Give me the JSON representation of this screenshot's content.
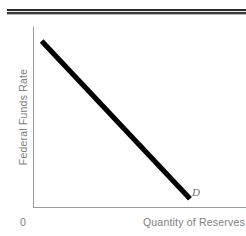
{
  "figure": {
    "name": "federal-funds-rate-demand-for-reserves",
    "background_color": "#ffffff",
    "top_rule": {
      "present": true,
      "color": "#2b2b2b"
    },
    "axes": {
      "color": "#9b9b9b",
      "origin_label": "0"
    },
    "labels": {
      "y_axis": "Federal Funds Rate",
      "x_axis": "Quantity of Reserves",
      "curve": "D"
    }
  },
  "chart_data": {
    "type": "line",
    "title": "",
    "subtitle": "",
    "xlabel": "Quantity of Reserves",
    "ylabel": "Federal Funds Rate",
    "xlim": [
      0,
      1
    ],
    "ylim": [
      0,
      1
    ],
    "grid": false,
    "legend": "inline-endpoint-label",
    "tick_labels": {
      "x": [],
      "y": [],
      "origin": "0"
    },
    "series": [
      {
        "name": "D",
        "label": "D",
        "description": "Downward-sloping demand curve for reserves",
        "color": "#000000",
        "line_width": 5,
        "x": [
          0.055,
          1.0
        ],
        "y": [
          1.0,
          0.05
        ],
        "points": [
          {
            "x": 0.055,
            "y": 1.0
          },
          {
            "x": 1.0,
            "y": 0.05
          }
        ]
      }
    ],
    "annotations": [
      {
        "text": "D",
        "x": 1.05,
        "y": 0.0,
        "style": "italic"
      }
    ]
  }
}
